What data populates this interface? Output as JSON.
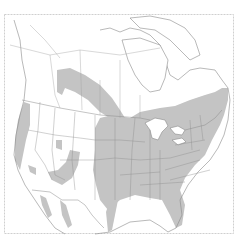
{
  "map": {
    "subject": "North America range map",
    "legend": [],
    "colors": {
      "background": "#ffffff",
      "land": "#ffffff",
      "range_fill": "#c4c4c4",
      "boundary": "#8a8a8a",
      "frame": "#cfcfcf"
    },
    "regions_shaded": [
      "Eastern United States",
      "Great Plains",
      "Southern Canadian Prairies band",
      "Pacific Coast",
      "Scattered Western patches",
      "Southern Ontario / Quebec"
    ]
  }
}
